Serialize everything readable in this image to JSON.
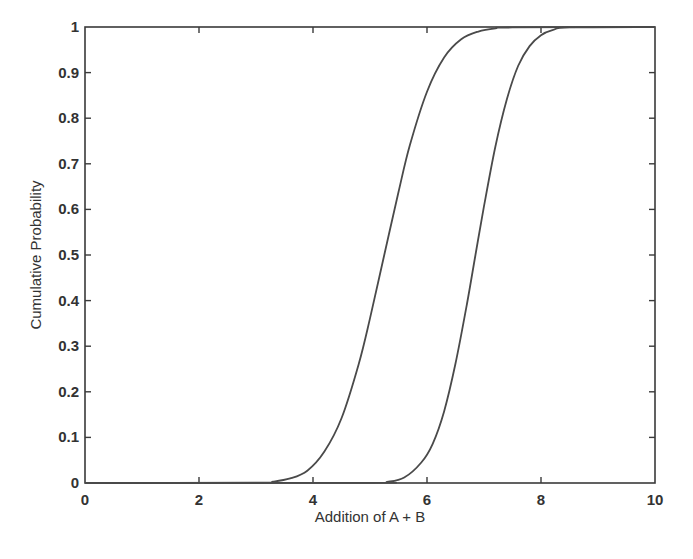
{
  "chart_data": {
    "type": "line",
    "title": "",
    "xlabel": "Addition of A + B",
    "ylabel": "Cumulative Probability",
    "xlim": [
      0,
      10
    ],
    "ylim": [
      0,
      1
    ],
    "x_ticks": [
      0,
      2,
      4,
      6,
      8,
      10
    ],
    "x_tick_labels": [
      "0",
      "2",
      "4",
      "6",
      "8",
      "10"
    ],
    "y_ticks": [
      0,
      0.1,
      0.2,
      0.3,
      0.4,
      0.5,
      0.6,
      0.7,
      0.8,
      0.9,
      1
    ],
    "y_tick_labels": [
      "0",
      "0.1",
      "0.2",
      "0.3",
      "0.4",
      "0.5",
      "0.6",
      "0.7",
      "0.8",
      "0.9",
      "1"
    ],
    "grid": false,
    "legend": null,
    "line_color": "#4a4a4a",
    "series": [
      {
        "name": "curve-1",
        "x": [
          0,
          3.0,
          3.3,
          3.6,
          3.9,
          4.2,
          4.5,
          4.8,
          5.0,
          5.25,
          5.5,
          5.7,
          6.0,
          6.3,
          6.6,
          6.9,
          7.2,
          7.5,
          10
        ],
        "y": [
          0,
          0.0006,
          0.003,
          0.01,
          0.027,
          0.069,
          0.142,
          0.26,
          0.361,
          0.5,
          0.638,
          0.741,
          0.858,
          0.933,
          0.973,
          0.99,
          0.997,
          0.999,
          1
        ]
      },
      {
        "name": "curve-2",
        "x": [
          0,
          5.0,
          5.3,
          5.6,
          5.9,
          6.1,
          6.3,
          6.5,
          6.7,
          6.85,
          7.0,
          7.2,
          7.4,
          7.6,
          7.8,
          8.0,
          8.2,
          8.5,
          10
        ],
        "y": [
          0,
          0.0004,
          0.0024,
          0.012,
          0.045,
          0.086,
          0.157,
          0.262,
          0.392,
          0.5,
          0.607,
          0.738,
          0.841,
          0.915,
          0.958,
          0.982,
          0.993,
          0.999,
          1
        ]
      }
    ]
  },
  "axes": {
    "xlabel": "Addition of A + B",
    "ylabel": "Cumulative Probability"
  }
}
